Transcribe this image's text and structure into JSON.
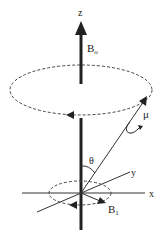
{
  "diagram": {
    "labels": {
      "z_axis": "z",
      "x_axis": "x",
      "y_axis": "y",
      "b0": "B",
      "b0_sub": "o",
      "b1": "B",
      "b1_sub": "1",
      "mu": "μ",
      "theta": "θ"
    },
    "colors": {
      "stroke": "#222222",
      "background": "#ffffff"
    }
  }
}
